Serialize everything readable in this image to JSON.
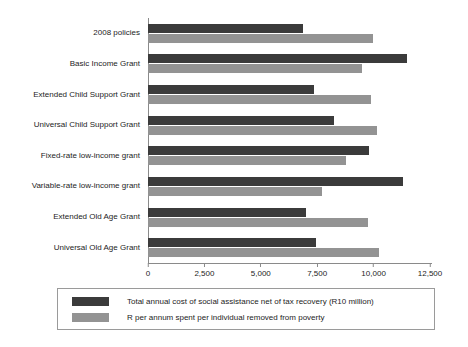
{
  "chart_data": {
    "type": "bar",
    "orientation": "horizontal",
    "title": "",
    "xlabel": "",
    "ylabel": "",
    "xlim": [
      0,
      12500
    ],
    "xticks": [
      0,
      2500,
      5000,
      7500,
      10000,
      12500
    ],
    "xtick_labels": [
      "0",
      "2,500",
      "5,000",
      "7,500",
      "10,000",
      "12,500"
    ],
    "grid": false,
    "legend_position": "bottom",
    "categories": [
      "2008 policies",
      "Basic Income Grant",
      "Extended Child Support Grant",
      "Universal Child Support Grant",
      "Fixed-rate low-income grant",
      "Variable-rate low-income grant",
      "Extended Old Age Grant",
      "Universal Old Age Grant"
    ],
    "series": [
      {
        "name": "Total annual cost of social assistance net of tax recovery (R10 million)",
        "color": "#3b3b3b",
        "values": [
          6850,
          11500,
          7370,
          8250,
          9800,
          11300,
          7000,
          7450
        ]
      },
      {
        "name": "R per annum spent per individual removed from poverty",
        "color": "#939393",
        "values": [
          9950,
          9500,
          9870,
          10130,
          8780,
          7700,
          9770,
          10250
        ]
      }
    ]
  },
  "legend": {
    "items": [
      {
        "label": "Total annual cost of social assistance net of tax recovery (R10 million)",
        "swatch": "series-a"
      },
      {
        "label": "R per annum spent per individual removed from poverty",
        "swatch": "series-b"
      }
    ]
  },
  "colors": {
    "series_a": "#3b3b3b",
    "series_b": "#939393",
    "axis": "#8a8a8a",
    "background": "#ffffff"
  }
}
